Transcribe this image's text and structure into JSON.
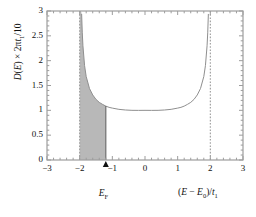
{
  "chart_data": {
    "type": "line",
    "title": "",
    "subtitle": "",
    "xlabel": "(E − E₀)/t₁",
    "ylabel": "D(E) × 2πt₁/10",
    "xlim": [
      -3,
      3
    ],
    "ylim": [
      0,
      3
    ],
    "grid": false,
    "legend": null,
    "x_ticks": [
      -3,
      -2,
      -1,
      0,
      1,
      2,
      3
    ],
    "x_tick_labels": [
      "−3",
      "−2",
      "−1",
      "0",
      "1",
      "2",
      "3"
    ],
    "y_ticks": [
      0,
      0.5,
      1,
      1.5,
      2,
      2.5,
      3
    ],
    "y_tick_labels": [
      "0",
      "0.5",
      "1",
      "1.5",
      "2",
      "2.5",
      "3"
    ],
    "x_minor_tick_step": 0.2,
    "series": [
      {
        "name": "density-of-states",
        "description": "U-shaped van Hove density of states, minimum 1.0 at x=0, diverging at x=±2",
        "color": "#8a8a8a",
        "minimum_value": 1.0,
        "minimum_at_x": 0,
        "asymptote_x": [
          -2,
          2
        ],
        "x": [
          -1.995,
          -1.99,
          -1.98,
          -1.96,
          -1.94,
          -1.92,
          -1.9,
          -1.85,
          -1.8,
          -1.7,
          -1.6,
          -1.5,
          -1.4,
          -1.3,
          -1.2,
          -1.1,
          -1.0,
          -0.8,
          -0.6,
          -0.4,
          -0.2,
          0.0,
          0.2,
          0.4,
          0.6,
          0.8,
          1.0,
          1.1,
          1.2,
          1.3,
          1.4,
          1.5,
          1.6,
          1.7,
          1.8,
          1.85,
          1.9,
          1.92,
          1.94,
          1.96,
          1.98,
          1.99,
          1.995
        ],
        "y": [
          10.01,
          7.09,
          5.03,
          3.58,
          2.94,
          2.56,
          2.3,
          1.9,
          1.68,
          1.44,
          1.31,
          1.22,
          1.16,
          1.12,
          1.085,
          1.06,
          1.045,
          1.02,
          1.007,
          1.0,
          0.999,
          1.0,
          0.999,
          1.0,
          1.007,
          1.02,
          1.045,
          1.06,
          1.085,
          1.12,
          1.16,
          1.22,
          1.31,
          1.44,
          1.68,
          1.9,
          2.3,
          2.56,
          2.94,
          3.58,
          5.03,
          7.09,
          10.01
        ]
      }
    ],
    "asymptote_lines": [
      {
        "name": "left-asymptote",
        "x": -2,
        "style": "dashed",
        "color": "#9a9a9a"
      },
      {
        "name": "right-asymptote",
        "x": 2,
        "style": "dashed",
        "color": "#9a9a9a"
      }
    ],
    "shaded_region": {
      "name": "filled-states",
      "x_start": -2,
      "x_end": -1.2,
      "color": "#b8b8b8",
      "label": "E_F"
    },
    "annotations": [
      {
        "name": "fermi-level-marker",
        "text": "EₒF",
        "display_text": "E",
        "sub": "F",
        "x": -1.2,
        "y": 0,
        "arrow": "up"
      }
    ]
  },
  "axes": {
    "x_axis_label": "(E − E₀)/t₁",
    "y_axis_label": "D(E) × 2πt₁/10"
  },
  "labels": {
    "fermi": "E",
    "fermi_sub": "F",
    "y_part1": "D",
    "y_part2": "(",
    "y_part3": "E",
    "y_part4": ") × 2π",
    "y_part5": "t",
    "y_part6": "1",
    "y_part7": "/10",
    "x_part1": "(",
    "x_part2": "E",
    "x_part3": " − ",
    "x_part4": "E",
    "x_part5": "0",
    "x_part6": ")/",
    "x_part7": "t",
    "x_part8": "1"
  }
}
